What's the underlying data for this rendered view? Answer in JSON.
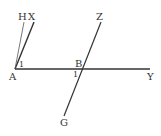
{
  "diagram": {
    "points": {
      "A": "A",
      "B": "B",
      "H": "H",
      "X": "X",
      "Y": "Y",
      "Z": "Z",
      "G": "G"
    },
    "angle_labels": {
      "at_A": "1",
      "at_B": "1"
    },
    "colors": {
      "line": "#333333",
      "text": "#333333",
      "background": "#ffffff"
    }
  }
}
